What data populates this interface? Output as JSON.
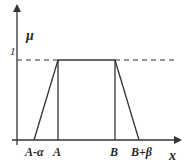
{
  "figure": {
    "type": "trapezoidal membership function",
    "y_axis_label": "μ",
    "x_axis_label": "x",
    "y_tick_label": "1",
    "x_tick_labels": [
      "A-α",
      "A",
      "B",
      "B+β"
    ],
    "colors": {
      "line": "#333333",
      "text": "#2a2a2a",
      "background": "#ffffff"
    }
  }
}
